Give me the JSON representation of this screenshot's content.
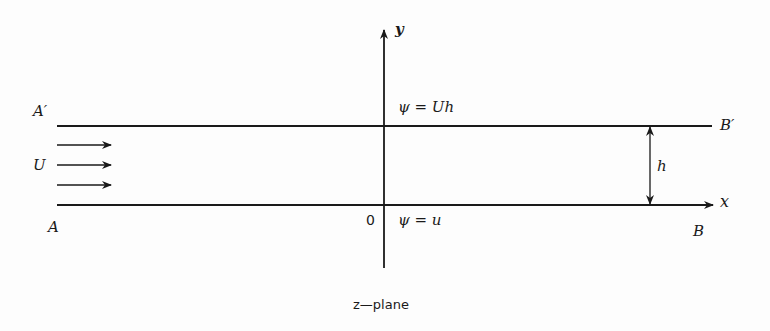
{
  "diagram": {
    "caption": "z—plane",
    "axes": {
      "x_label": "x",
      "y_label": "y",
      "origin_label": "0"
    },
    "walls": {
      "upper_left_label": "A′",
      "upper_right_label": "B′",
      "lower_left_label": "A",
      "lower_right_label": "B"
    },
    "streamlines": {
      "upper": "ψ = Uh",
      "lower": "ψ = u"
    },
    "flow": {
      "velocity_label": "U",
      "arrow_count": 3
    },
    "channel": {
      "height_label": "h"
    },
    "colors": {
      "ink": "#1a1a1a",
      "background": "#fdfdfd"
    }
  }
}
